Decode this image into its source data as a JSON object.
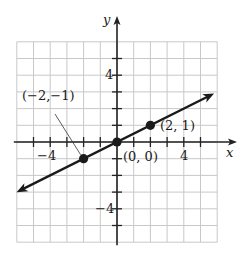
{
  "chart_data": {
    "type": "line",
    "title": "",
    "xlabel": "x",
    "ylabel": "y",
    "xlim": [
      -6,
      6
    ],
    "ylim": [
      -6,
      6
    ],
    "grid": true,
    "x_tick_labels": [
      {
        "value": -4,
        "label": "−4"
      },
      {
        "value": 4,
        "label": "4"
      }
    ],
    "y_tick_labels": [
      {
        "value": 4,
        "label": "4"
      },
      {
        "value": -4,
        "label": "−4"
      }
    ],
    "series": [
      {
        "name": "y = x/2",
        "equation": "y = (1/2)x",
        "slope": 0.5,
        "intercept": 0,
        "arrows_both_ends": true,
        "x_range": [
          -5.8,
          5.6
        ],
        "points": [
          {
            "x": -2,
            "y": -1,
            "label": "(−2,−1)"
          },
          {
            "x": 0,
            "y": 0,
            "label": "(0, 0)"
          },
          {
            "x": 2,
            "y": 1,
            "label": "(2, 1)"
          }
        ]
      }
    ],
    "annotations": [
      {
        "text": "(−2,−1)",
        "points_to": {
          "x": -2,
          "y": -1
        },
        "leader_line": true
      },
      {
        "text": "(0, 0)",
        "near": {
          "x": 0,
          "y": 0
        }
      },
      {
        "text": "(2, 1)",
        "near": {
          "x": 2,
          "y": 1
        }
      }
    ]
  },
  "labels": {
    "x_axis": "x",
    "y_axis": "y",
    "x_tick_neg4": "−4",
    "x_tick_4": "4",
    "y_tick_4": "4",
    "y_tick_neg4": "−4",
    "point_neg2_neg1": "(−2,−1)",
    "point_origin": "(0, 0)",
    "point_2_1": "(2, 1)"
  },
  "colors": {
    "grid": "#c8c8c8",
    "axis": "#222222",
    "line": "#1a1a1a"
  }
}
